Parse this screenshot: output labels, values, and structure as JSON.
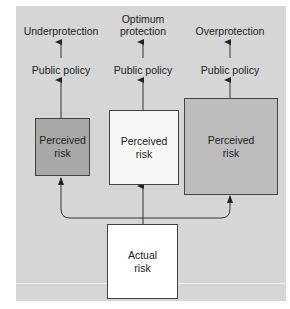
{
  "outcomes": [
    {
      "label": "Underprotection"
    },
    {
      "label_line1": "Optimum",
      "label_line2": "protection"
    },
    {
      "label": "Overprotection"
    }
  ],
  "policy": [
    {
      "label": "Public policy"
    },
    {
      "label": "Public policy"
    },
    {
      "label": "Public policy"
    }
  ],
  "perceived": [
    {
      "line1": "Perceived",
      "line2": "risk",
      "fill": "#a9a9a9"
    },
    {
      "line1": "Perceived",
      "line2": "risk",
      "fill": "#f7f7f7"
    },
    {
      "line1": "Perceived",
      "line2": "risk",
      "fill": "#bdbdbd"
    }
  ],
  "actual": {
    "line1": "Actual",
    "line2": "risk",
    "fill": "#ffffff"
  },
  "colors": {
    "background_panel": "#d6d6d6",
    "line": "#333333"
  }
}
